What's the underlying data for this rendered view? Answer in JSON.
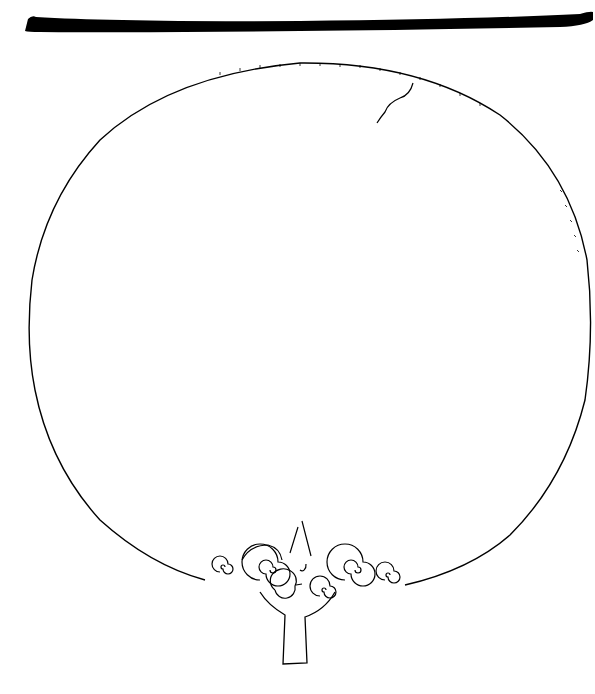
{
  "figure": {
    "parts": [
      "profile-section",
      "mirror-disc",
      "crack",
      "handle-tang",
      "spiral-ornament"
    ],
    "colors": {
      "ink": "#000000",
      "paper": "#ffffff"
    }
  }
}
